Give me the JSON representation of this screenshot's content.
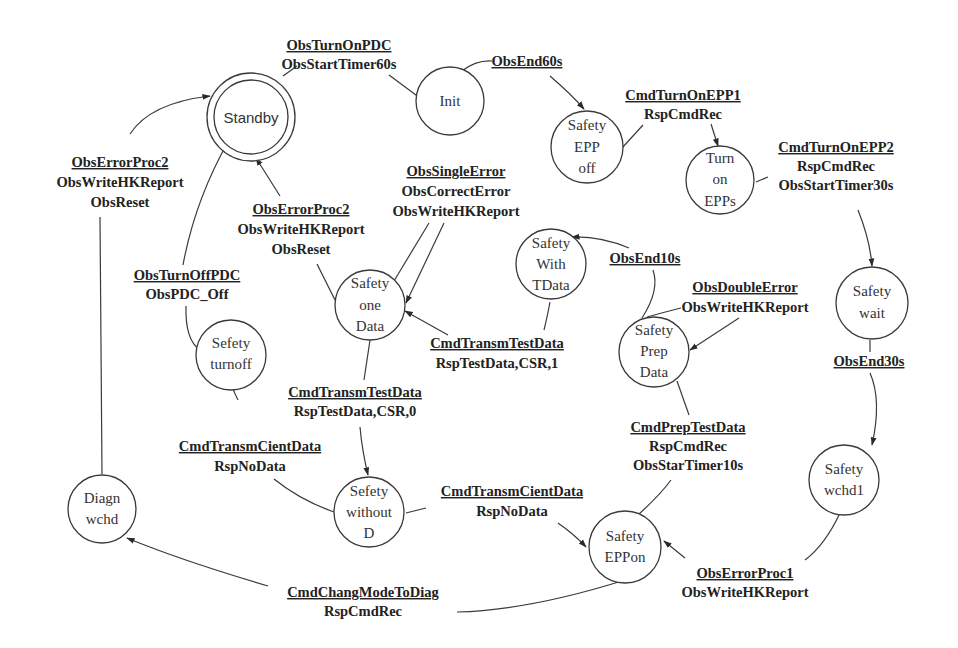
{
  "diagram": {
    "type": "state-machine",
    "states": {
      "standby": {
        "lines": [
          "Standby"
        ],
        "initial": true
      },
      "init": {
        "lines": [
          "Init"
        ]
      },
      "safety_epp_off": {
        "lines": [
          "Safety",
          "EPP",
          "off"
        ]
      },
      "turn_on_epps": {
        "lines": [
          "Turn",
          "on",
          "EPPs"
        ]
      },
      "safety_wait": {
        "lines": [
          "Safety",
          "wait"
        ]
      },
      "safety_wchd1": {
        "lines": [
          "Safety",
          "wchd1"
        ]
      },
      "safety_epp_on": {
        "lines": [
          "Safety",
          "EPPon"
        ]
      },
      "safety_prep_data": {
        "lines": [
          "Safety",
          "Prep",
          "Data"
        ]
      },
      "safety_with_tdata": {
        "lines": [
          "Safety",
          "With",
          "TData"
        ]
      },
      "safety_one_data": {
        "lines": [
          "Safety",
          "one",
          "Data"
        ]
      },
      "sefety_without_d": {
        "lines": [
          "Sefety",
          "without",
          "D"
        ]
      },
      "sefety_turnoff": {
        "lines": [
          "Sefety",
          "turnoff"
        ]
      },
      "diagn_wchd": {
        "lines": [
          "Diagn",
          "wchd"
        ]
      }
    },
    "transitions": [
      {
        "id": "t1",
        "from": "Standby",
        "to": "Init",
        "event": "ObsTurnOnPDC",
        "actions": [
          "ObsStartTimer60s"
        ]
      },
      {
        "id": "t2",
        "from": "Init",
        "to": "Safety EPP off",
        "event": "ObsEnd60s",
        "actions": []
      },
      {
        "id": "t3",
        "from": "Safety EPP off",
        "to": "Turn on EPPs",
        "event": "CmdTurnOnEPP1",
        "actions": [
          "RspCmdRec"
        ]
      },
      {
        "id": "t4",
        "from": "Turn on EPPs",
        "to": "Safety wait",
        "event": "CmdTurnOnEPP2",
        "actions": [
          "RspCmdRec",
          "ObsStartTimer30s"
        ]
      },
      {
        "id": "t5",
        "from": "Safety wait",
        "to": "Safety wchd1",
        "event": "ObsEnd30s",
        "actions": []
      },
      {
        "id": "t6",
        "from": "Safety wchd1",
        "to": "Safety EPPon",
        "event": "ObsErrorProc1",
        "actions": [
          "ObsWriteHKReport"
        ]
      },
      {
        "id": "t7",
        "from": "Safety EPPon",
        "to": "Safety Prep Data",
        "event": "CmdPrepTestData",
        "actions": [
          "RspCmdRec",
          "ObsStarTimer10s"
        ]
      },
      {
        "id": "t8",
        "from": "Safety Prep Data",
        "to": "Safety With TData",
        "event": "ObsEnd10s",
        "actions": []
      },
      {
        "id": "t9",
        "from": "Safety Prep Data",
        "to": "Safety Prep Data",
        "event": "ObsDoubleError",
        "actions": [
          "ObsWriteHKReport"
        ]
      },
      {
        "id": "t10",
        "from": "Safety With TData",
        "to": "Safety one Data",
        "event": "CmdTransmTestData",
        "actions": [
          "RspTestData,CSR,1"
        ]
      },
      {
        "id": "t11",
        "from": "Safety one Data",
        "to": "Safety one Data",
        "event": "ObsSingleError",
        "actions": [
          "ObsCorrectError",
          "ObsWriteHKReport"
        ]
      },
      {
        "id": "t12",
        "from": "Safety one Data",
        "to": "Standby",
        "event": "ObsErrorProc2",
        "actions": [
          "ObsWriteHKReport",
          "ObsReset"
        ]
      },
      {
        "id": "t13",
        "from": "Safety one Data",
        "to": "Sefety without D",
        "event": "CmdTransmTestData",
        "actions": [
          "RspTestData,CSR,0"
        ]
      },
      {
        "id": "t14",
        "from": "Sefety without D",
        "to": "Safety EPPon",
        "event": "CmdTransmCientData",
        "actions": [
          "RspNoData"
        ]
      },
      {
        "id": "t15",
        "from": "Sefety without D",
        "to": "Sefety turnoff",
        "event": "CmdTransmCientData",
        "actions": [
          "RspNoData"
        ]
      },
      {
        "id": "t16",
        "from": "Sefety turnoff",
        "to": "Standby",
        "event": "ObsTurnOffPDC",
        "actions": [
          "ObsPDC_Off"
        ]
      },
      {
        "id": "t17",
        "from": "Safety EPPon",
        "to": "Diagn wchd",
        "event": "CmdChangModeToDiag",
        "actions": [
          "RspCmdRec"
        ]
      },
      {
        "id": "t18",
        "from": "Diagn wchd",
        "to": "Standby",
        "event": "ObsErrorProc2",
        "actions": [
          "ObsWriteHKReport",
          "ObsReset"
        ]
      }
    ]
  }
}
